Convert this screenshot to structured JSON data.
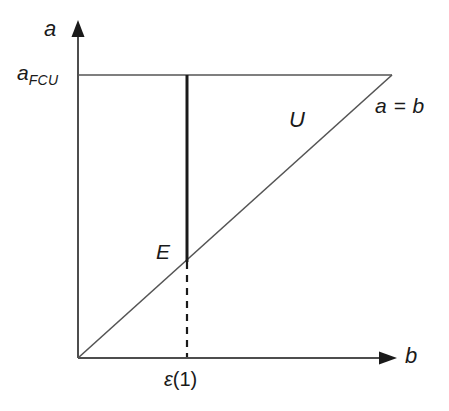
{
  "figure": {
    "type": "diagram",
    "background_color": "#ffffff",
    "axis_color": "#4d4d4d",
    "line_color": "#555555",
    "emphasis_color": "#1a1a1a",
    "text_color": "#1a1a1a"
  },
  "axes": {
    "y_axis_label": "a",
    "x_axis_label": "b",
    "y_tick_label": "a",
    "y_tick_subscript": "FCU",
    "x_tick_label_symbol": "ε",
    "x_tick_label_arg": "(1)"
  },
  "annotations": {
    "diagonal_label": "a = b",
    "region_label": "U",
    "point_label": "E"
  },
  "geometry": {
    "origin": {
      "x": 78,
      "y": 358
    },
    "y_axis_tip": {
      "x": 78,
      "y": 22
    },
    "x_axis_tip": {
      "x": 396,
      "y": 358
    },
    "afcu_level_y": 75,
    "afcu_line_x_end": 392,
    "diagonal_start": {
      "x": 78,
      "y": 358
    },
    "diagonal_end": {
      "x": 392,
      "y": 75
    },
    "vertical_segment_x": 187,
    "vertical_segment_top_y": 75,
    "vertical_segment_bottom_y": 262,
    "dashed_segment_top_y": 262,
    "dashed_segment_bottom_y": 358
  }
}
